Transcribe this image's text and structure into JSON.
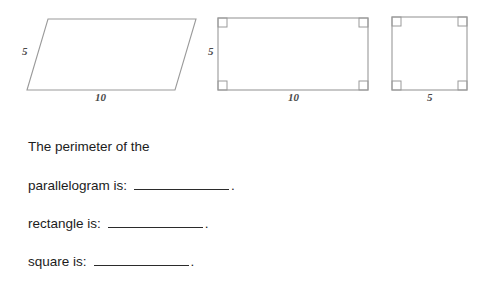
{
  "document": {
    "type": "geometry-worksheet",
    "stroke_color": "#9a9a9a",
    "label_color": "#4a4a4a",
    "text_color": "#1c1c1c",
    "background_color": "#ffffff"
  },
  "figures": [
    {
      "name": "parallelogram",
      "shape": "parallelogram",
      "side_label": "5",
      "base_label": "10",
      "has_right_angle_marks": false
    },
    {
      "name": "rectangle",
      "shape": "rectangle",
      "side_label": "5",
      "base_label": "10",
      "has_right_angle_marks": true
    },
    {
      "name": "square",
      "shape": "square",
      "side_label": "",
      "base_label": "5",
      "has_right_angle_marks": true
    }
  ],
  "prompt": {
    "intro": "The perimeter of the",
    "questions": [
      {
        "label": "parallelogram is:",
        "answer": "",
        "terminator": "."
      },
      {
        "label": "rectangle is:",
        "answer": "",
        "terminator": "."
      },
      {
        "label": "square is:",
        "answer": "",
        "terminator": "."
      }
    ]
  }
}
